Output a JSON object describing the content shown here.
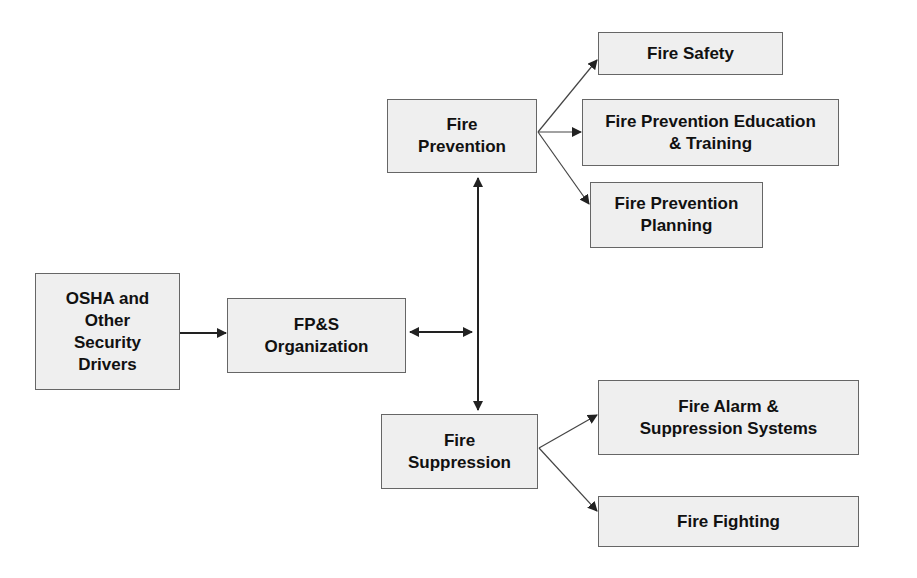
{
  "nodes": {
    "osha": {
      "label": "OSHA  and\nOther\nSecurity\nDrivers"
    },
    "fps": {
      "label": "FP&S\nOrganization"
    },
    "prevention": {
      "label": "Fire\nPrevention"
    },
    "suppression": {
      "label": "Fire\nSuppression"
    },
    "safety": {
      "label": "Fire Safety"
    },
    "education": {
      "label": "Fire Prevention Education\n& Training"
    },
    "planning": {
      "label": "Fire Prevention\nPlanning"
    },
    "alarm": {
      "label": "Fire Alarm &\nSuppression Systems"
    },
    "fighting": {
      "label": "Fire Fighting"
    }
  },
  "colors": {
    "box_fill": "#efefef",
    "box_border": "#666666",
    "line": "#222222"
  }
}
